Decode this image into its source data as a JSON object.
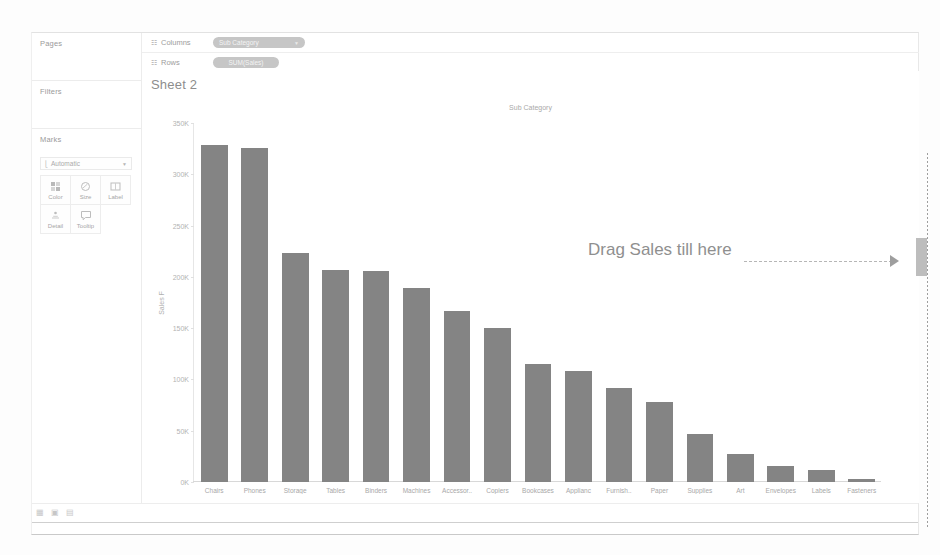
{
  "sheet": {
    "title": "Sheet 2"
  },
  "cards": {
    "pages": {
      "label": "Pages"
    },
    "filters": {
      "label": "Filters"
    },
    "marks": {
      "label": "Marks",
      "type_select": {
        "value": "Automatic",
        "icon": "bar-mark-icon",
        "caret": "chevron-down-icon"
      },
      "buttons": [
        {
          "label": "Color",
          "icon": "color-icon"
        },
        {
          "label": "Size",
          "icon": "size-icon"
        },
        {
          "label": "Label",
          "icon": "label-icon"
        },
        {
          "label": "Detail",
          "icon": "detail-icon"
        },
        {
          "label": "Tooltip",
          "icon": "tooltip-icon"
        }
      ]
    }
  },
  "shelves": [
    {
      "name": "Columns",
      "icon": "grid-icon",
      "pill": "Sub Category",
      "pill_caret": "chevron-down-icon"
    },
    {
      "name": "Rows",
      "icon": "grid-icon",
      "pill": "SUM(Sales)",
      "pill_caret": ""
    }
  ],
  "annotation": {
    "text": "Drag Sales till here",
    "arrow_icon": "arrow-right-icon",
    "drop_target_name": "row-shelf-drop-zone"
  },
  "statusbar": {
    "tabs": [
      {
        "icon": "sheet-tab-icon"
      },
      {
        "icon": "new-worksheet-icon"
      },
      {
        "icon": "new-dashboard-icon"
      }
    ]
  },
  "chart_data": {
    "type": "bar",
    "title": "Sub Category",
    "xlabel": "Sub Category",
    "ylabel": "Sales F",
    "grid": false,
    "legend": "none",
    "ylim": [
      0,
      350000
    ],
    "ytick_labels": [
      "350K",
      "300K",
      "250K",
      "200K",
      "150K",
      "100K",
      "50K",
      "0K"
    ],
    "ytick_values": [
      350000,
      300000,
      250000,
      200000,
      150000,
      100000,
      50000,
      0
    ],
    "categories": [
      "Chairs",
      "Phones",
      "Storage",
      "Tables",
      "Binders",
      "Machines",
      "Accessor..",
      "Copiers",
      "Bookcases",
      "Applianc",
      "Furnish..",
      "Paper",
      "Supplies",
      "Art",
      "Envelopes",
      "Labels",
      "Fasteners"
    ],
    "values": [
      329000,
      326000,
      223000,
      207000,
      206000,
      189000,
      167000,
      150000,
      115000,
      108000,
      92000,
      78000,
      47000,
      27000,
      16000,
      12000,
      3000
    ]
  }
}
